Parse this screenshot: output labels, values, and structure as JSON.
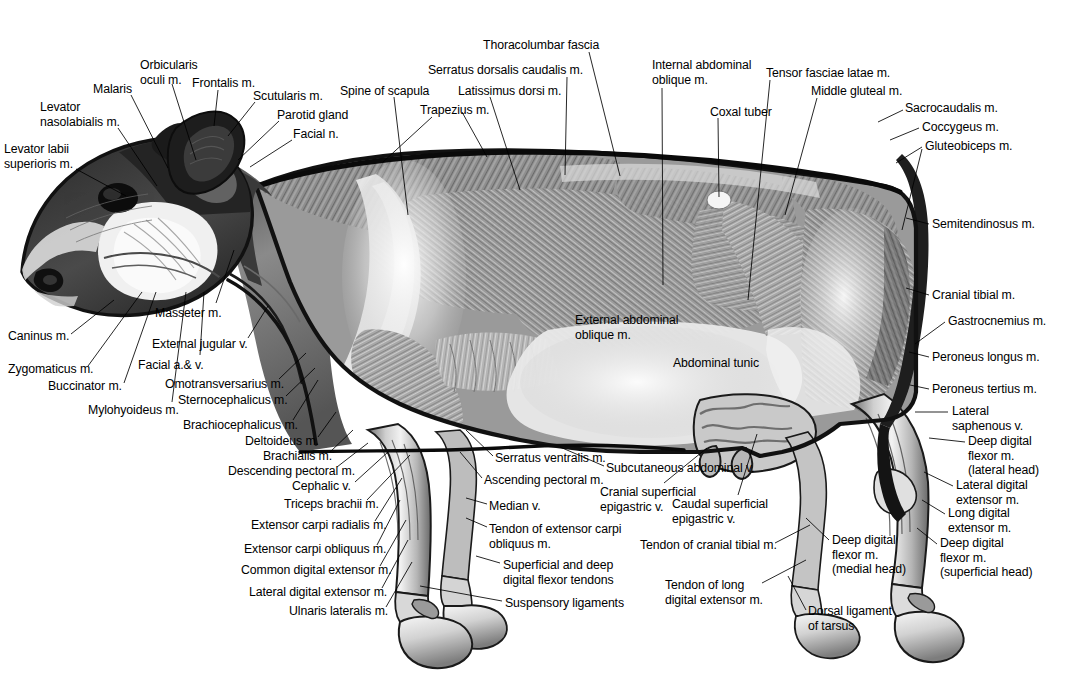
{
  "figure": {
    "background_color": "#ffffff",
    "ink_color": "#000000",
    "width": 1085,
    "height": 696
  },
  "labels": [
    {
      "id": "levator-labii-superioris",
      "text": "Levator labii\nsuperioris m.",
      "x": 4,
      "y": 142,
      "align": "l",
      "leader": [
        [
          76,
          169
        ],
        [
          126,
          196
        ]
      ]
    },
    {
      "id": "levator-nasolabialis",
      "text": "Levator\nnasolabialis m.",
      "x": 40,
      "y": 100,
      "align": "l",
      "leader": [
        [
          118,
          128
        ],
        [
          157,
          186
        ]
      ]
    },
    {
      "id": "malaris",
      "text": "Malaris",
      "x": 93,
      "y": 82,
      "align": "l",
      "leader": [
        [
          131,
          95
        ],
        [
          168,
          168
        ]
      ]
    },
    {
      "id": "orbicularis-oculi",
      "text": "Orbicularis\noculi m.",
      "x": 140,
      "y": 58,
      "align": "l",
      "leader": [
        [
          172,
          84
        ],
        [
          196,
          160
        ]
      ]
    },
    {
      "id": "frontalis",
      "text": "Frontalis m.",
      "x": 192,
      "y": 76,
      "align": "l",
      "leader": [
        [
          218,
          90
        ],
        [
          214,
          126
        ]
      ]
    },
    {
      "id": "scutularis",
      "text": "Scutularis m.",
      "x": 253,
      "y": 89,
      "align": "l",
      "leader": [
        [
          255,
          102
        ],
        [
          228,
          136
        ]
      ]
    },
    {
      "id": "parotid-gland",
      "text": "Parotid gland",
      "x": 277,
      "y": 108,
      "align": "l",
      "leader": [
        [
          279,
          121
        ],
        [
          238,
          160
        ]
      ]
    },
    {
      "id": "facial-n",
      "text": "Facial n.",
      "x": 293,
      "y": 127,
      "align": "l",
      "leader": [
        [
          292,
          140
        ],
        [
          250,
          167
        ]
      ]
    },
    {
      "id": "spine-of-scapula",
      "text": "Spine of scapula",
      "x": 340,
      "y": 84,
      "align": "l",
      "leader": [
        [
          394,
          97
        ],
        [
          408,
          215
        ]
      ]
    },
    {
      "id": "trapezius",
      "text": "Trapezius m.",
      "x": 420,
      "y": 103,
      "align": "l",
      "leader": [
        [
          432,
          117
        ],
        [
          383,
          162
        ]
      ]
    },
    {
      "id": "trapezius-2",
      "text": "",
      "x": 0,
      "y": 0,
      "align": "l",
      "leader": [
        [
          462,
          112
        ],
        [
          487,
          157
        ]
      ]
    },
    {
      "id": "latissimus-dorsi",
      "text": "Latissimus dorsi m.",
      "x": 458,
      "y": 84,
      "align": "l",
      "leader": [
        [
          490,
          97
        ],
        [
          520,
          190
        ]
      ]
    },
    {
      "id": "serratus-dorsalis-caudalis",
      "text": "Serratus dorsalis caudalis m.",
      "x": 428,
      "y": 63,
      "align": "l",
      "leader": [
        [
          567,
          77
        ],
        [
          565,
          175
        ]
      ]
    },
    {
      "id": "thoracolumbar-fascia",
      "text": "Thoracolumbar fascia",
      "x": 483,
      "y": 38,
      "align": "l",
      "leader": [
        [
          589,
          52
        ],
        [
          620,
          176
        ]
      ]
    },
    {
      "id": "internal-abdominal-oblique",
      "text": "Internal abdominal\noblique m.",
      "x": 652,
      "y": 58,
      "align": "l",
      "leader": [
        [
          662,
          88
        ],
        [
          663,
          285
        ]
      ]
    },
    {
      "id": "coxal-tuber",
      "text": "Coxal tuber",
      "x": 710,
      "y": 105,
      "align": "l",
      "leader": [
        [
          718,
          118
        ],
        [
          719,
          197
        ]
      ]
    },
    {
      "id": "tensor-fasciae-latae",
      "text": "Tensor fasciae latae m.",
      "x": 766,
      "y": 66,
      "align": "l",
      "leader": [
        [
          770,
          80
        ],
        [
          748,
          300
        ]
      ]
    },
    {
      "id": "middle-gluteal",
      "text": "Middle gluteal m.",
      "x": 811,
      "y": 84,
      "align": "l",
      "leader": [
        [
          817,
          98
        ],
        [
          785,
          215
        ]
      ]
    },
    {
      "id": "sacrocaudalis",
      "text": "Sacrocaudalis m.",
      "x": 905,
      "y": 101,
      "align": "l",
      "leader": [
        [
          903,
          110
        ],
        [
          878,
          122
        ]
      ]
    },
    {
      "id": "coccygeus",
      "text": "Coccygeus m.",
      "x": 922,
      "y": 120,
      "align": "l",
      "leader": [
        [
          919,
          128
        ],
        [
          890,
          140
        ]
      ]
    },
    {
      "id": "gluteobiceps",
      "text": "Gluteobiceps m.",
      "x": 925,
      "y": 139,
      "align": "l",
      "leader": [
        [
          922,
          147
        ],
        [
          896,
          163
        ]
      ]
    },
    {
      "id": "gluteobiceps-2",
      "text": "",
      "x": 0,
      "y": 0,
      "align": "l",
      "leader": [
        [
          922,
          149
        ],
        [
          902,
          230
        ]
      ]
    },
    {
      "id": "semitendinosus",
      "text": "Semitendinosus m.",
      "x": 932,
      "y": 217,
      "align": "l",
      "leader": [
        [
          929,
          224
        ],
        [
          906,
          218
        ]
      ]
    },
    {
      "id": "cranial-tibial",
      "text": "Cranial tibial m.",
      "x": 932,
      "y": 288,
      "align": "l",
      "leader": [
        [
          929,
          295
        ],
        [
          906,
          288
        ]
      ]
    },
    {
      "id": "gastrocnemius",
      "text": "Gastrocnemius m.",
      "x": 948,
      "y": 314,
      "align": "l",
      "leader": [
        [
          945,
          322
        ],
        [
          915,
          344
        ]
      ]
    },
    {
      "id": "peroneus-longus",
      "text": "Peroneus longus m.",
      "x": 932,
      "y": 350,
      "align": "l",
      "leader": [
        [
          929,
          357
        ],
        [
          909,
          352
        ]
      ]
    },
    {
      "id": "peroneus-tertius",
      "text": "Peroneus tertius m.",
      "x": 932,
      "y": 382,
      "align": "l",
      "leader": [
        [
          929,
          389
        ],
        [
          910,
          385
        ]
      ]
    },
    {
      "id": "lateral-saphenous",
      "text": "Lateral\nsaphenous v.",
      "x": 952,
      "y": 404,
      "align": "l",
      "leader": [
        [
          948,
          412
        ],
        [
          915,
          412
        ]
      ]
    },
    {
      "id": "deep-digital-flexor-lateral",
      "text": "Deep digital\nflexor m.\n(lateral head)",
      "x": 968,
      "y": 434,
      "align": "l",
      "leader": [
        [
          965,
          442
        ],
        [
          929,
          438
        ]
      ]
    },
    {
      "id": "lateral-digital-extensor",
      "text": "Lateral digital\nextensor m.",
      "x": 956,
      "y": 478,
      "align": "l",
      "leader": [
        [
          953,
          486
        ],
        [
          924,
          472
        ]
      ]
    },
    {
      "id": "long-digital-extensor",
      "text": "Long digital\nextensor m.",
      "x": 948,
      "y": 506,
      "align": "l",
      "leader": [
        [
          945,
          514
        ],
        [
          922,
          500
        ]
      ]
    },
    {
      "id": "deep-digital-flexor-superficial",
      "text": "Deep digital\nflexor m.\n(superficial head)",
      "x": 940,
      "y": 536,
      "align": "l",
      "leader": [
        [
          937,
          544
        ],
        [
          917,
          528
        ]
      ]
    },
    {
      "id": "caninus",
      "text": "Caninus m.",
      "x": 8,
      "y": 329,
      "align": "l",
      "leader": [
        [
          71,
          334
        ],
        [
          114,
          300
        ]
      ]
    },
    {
      "id": "zygomaticus",
      "text": "Zygomaticus m.",
      "x": 8,
      "y": 362,
      "align": "l",
      "leader": [
        [
          88,
          366
        ],
        [
          142,
          292
        ]
      ]
    },
    {
      "id": "buccinator",
      "text": "Buccinator m.",
      "x": 48,
      "y": 379,
      "align": "l",
      "leader": [
        [
          124,
          383
        ],
        [
          156,
          292
        ]
      ]
    },
    {
      "id": "mylohyoideus",
      "text": "Mylohyoideus m.",
      "x": 88,
      "y": 403,
      "align": "l",
      "leader": [
        [
          172,
          402
        ],
        [
          186,
          292
        ]
      ]
    },
    {
      "id": "masseter",
      "text": "Masseter m.",
      "x": 155,
      "y": 306,
      "align": "l",
      "leader": [
        [
          216,
          303
        ],
        [
          234,
          250
        ]
      ]
    },
    {
      "id": "external-jugular",
      "text": "External jugular v.",
      "x": 152,
      "y": 337,
      "align": "l",
      "leader": [
        [
          248,
          338
        ],
        [
          268,
          306
        ]
      ]
    },
    {
      "id": "facial-a-v",
      "text": "Facial a.& v.",
      "x": 138,
      "y": 358,
      "align": "l",
      "leader": [
        [
          200,
          355
        ],
        [
          204,
          292
        ]
      ]
    },
    {
      "id": "omotransversarius",
      "text": "Omotransversarius m.",
      "x": 165,
      "y": 377,
      "align": "l",
      "leader": [
        [
          279,
          379
        ],
        [
          306,
          353
        ]
      ]
    },
    {
      "id": "sternocephalicus",
      "text": "Sternocephalicus m.",
      "x": 178,
      "y": 393,
      "align": "l",
      "leader": [
        [
          286,
          396
        ],
        [
          315,
          368
        ]
      ]
    },
    {
      "id": "brachiocephalicus",
      "text": "Brachiocephalicus m.",
      "x": 183,
      "y": 418,
      "align": "l",
      "leader": [
        [
          293,
          420
        ],
        [
          318,
          380
        ]
      ]
    },
    {
      "id": "deltoideus",
      "text": "Deltoideus m.",
      "x": 245,
      "y": 434,
      "align": "l",
      "leader": [
        [
          318,
          437
        ],
        [
          336,
          412
        ]
      ]
    },
    {
      "id": "brachialis",
      "text": "Brachialis m.",
      "x": 263,
      "y": 449,
      "align": "l",
      "leader": [
        [
          330,
          452
        ],
        [
          353,
          430
        ]
      ]
    },
    {
      "id": "descending-pectoral",
      "text": "Descending pectoral m.",
      "x": 228,
      "y": 464,
      "align": "l",
      "leader": [
        [
          337,
          467
        ],
        [
          368,
          443
        ]
      ]
    },
    {
      "id": "cephalic-v",
      "text": "Cephalic v.",
      "x": 292,
      "y": 479,
      "align": "l",
      "leader": [
        [
          355,
          482
        ],
        [
          388,
          452
        ]
      ]
    },
    {
      "id": "triceps-brachii",
      "text": "Triceps brachii m.",
      "x": 284,
      "y": 497,
      "align": "l",
      "leader": [
        [
          367,
          500
        ],
        [
          410,
          455
        ]
      ]
    },
    {
      "id": "extensor-carpi-radialis",
      "text": "Extensor carpi radialis m.",
      "x": 251,
      "y": 518,
      "align": "l",
      "leader": [
        [
          375,
          521
        ],
        [
          402,
          478
        ]
      ]
    },
    {
      "id": "extensor-carpi-obliquus",
      "text": "Extensor carpi obliquus m.",
      "x": 244,
      "y": 542,
      "align": "l",
      "leader": [
        [
          377,
          545
        ],
        [
          400,
          500
        ]
      ]
    },
    {
      "id": "common-digital-extensor",
      "text": "Common digital extensor m.",
      "x": 241,
      "y": 563,
      "align": "l",
      "leader": [
        [
          380,
          566
        ],
        [
          406,
          520
        ]
      ]
    },
    {
      "id": "lateral-digital-extensor-fore",
      "text": "Lateral digital extensor m.",
      "x": 249,
      "y": 585,
      "align": "l",
      "leader": [
        [
          382,
          588
        ],
        [
          408,
          540
        ]
      ]
    },
    {
      "id": "ulnaris-lateralis",
      "text": "Ulnaris lateralis m.",
      "x": 289,
      "y": 604,
      "align": "l",
      "leader": [
        [
          386,
          607
        ],
        [
          412,
          562
        ]
      ]
    },
    {
      "id": "serratus-ventralis",
      "text": "Serratus ventralis m.",
      "x": 495,
      "y": 451,
      "align": "l",
      "leader": [
        [
          493,
          456
        ],
        [
          466,
          430
        ]
      ]
    },
    {
      "id": "ascending-pectoral",
      "text": "Ascending pectoral m.",
      "x": 484,
      "y": 473,
      "align": "l",
      "leader": [
        [
          482,
          478
        ],
        [
          460,
          452
        ]
      ]
    },
    {
      "id": "median-v",
      "text": "Median v.",
      "x": 489,
      "y": 499,
      "align": "l",
      "leader": [
        [
          487,
          504
        ],
        [
          466,
          498
        ]
      ]
    },
    {
      "id": "tendon-extensor-carpi-obliquus",
      "text": "Tendon of extensor carpi\nobliquus m.",
      "x": 489,
      "y": 522,
      "align": "l",
      "leader": [
        [
          487,
          527
        ],
        [
          466,
          518
        ]
      ]
    },
    {
      "id": "superficial-deep-flexor-tendons",
      "text": "Superficial and deep\ndigital flexor tendons",
      "x": 503,
      "y": 558,
      "align": "l",
      "leader": [
        [
          500,
          563
        ],
        [
          476,
          556
        ]
      ]
    },
    {
      "id": "suspensory-ligaments",
      "text": "Suspensory ligaments",
      "x": 505,
      "y": 596,
      "align": "l",
      "leader": [
        [
          502,
          601
        ],
        [
          420,
          586
        ]
      ]
    },
    {
      "id": "subcutaneous-abdominal-v",
      "text": "Subcutaneous abdominal v.",
      "x": 606,
      "y": 461,
      "align": "l",
      "leader": [
        [
          604,
          466
        ],
        [
          560,
          447
        ]
      ]
    },
    {
      "id": "cranial-superficial-epigastric",
      "text": "Cranial superficial\nepigastric v.",
      "x": 600,
      "y": 485,
      "align": "l",
      "leader": [
        [
          664,
          483
        ],
        [
          707,
          448
        ]
      ]
    },
    {
      "id": "caudal-superficial-epigastric",
      "text": "Caudal superficial\nepigastric v.",
      "x": 672,
      "y": 497,
      "align": "l",
      "leader": [
        [
          738,
          495
        ],
        [
          757,
          434
        ]
      ]
    },
    {
      "id": "tendon-cranial-tibial",
      "text": "Tendon of cranial tibial m.",
      "x": 640,
      "y": 538,
      "align": "l",
      "leader": [
        [
          775,
          543
        ],
        [
          810,
          525
        ]
      ]
    },
    {
      "id": "tendon-long-digital-extensor",
      "text": "Tendon of long\ndigital extensor m.",
      "x": 665,
      "y": 578,
      "align": "l",
      "leader": [
        [
          762,
          583
        ],
        [
          806,
          560
        ]
      ]
    },
    {
      "id": "deep-digital-flexor-medial",
      "text": "Deep digital\nflexor m.\n(medial head)",
      "x": 832,
      "y": 533,
      "align": "l",
      "leader": [
        [
          829,
          540
        ],
        [
          806,
          518
        ]
      ]
    },
    {
      "id": "dorsal-ligament-of-tarsus",
      "text": "Dorsal ligament\nof tarsus",
      "x": 808,
      "y": 604,
      "align": "l",
      "leader": [
        [
          806,
          610
        ],
        [
          788,
          576
        ]
      ]
    },
    {
      "id": "external-abdominal-oblique",
      "text": "External abdominal\noblique m.",
      "x": 575,
      "y": 313,
      "align": "l",
      "leader": null
    },
    {
      "id": "abdominal-tunic",
      "text": "Abdominal tunic",
      "x": 673,
      "y": 356,
      "align": "l",
      "leader": null
    }
  ]
}
